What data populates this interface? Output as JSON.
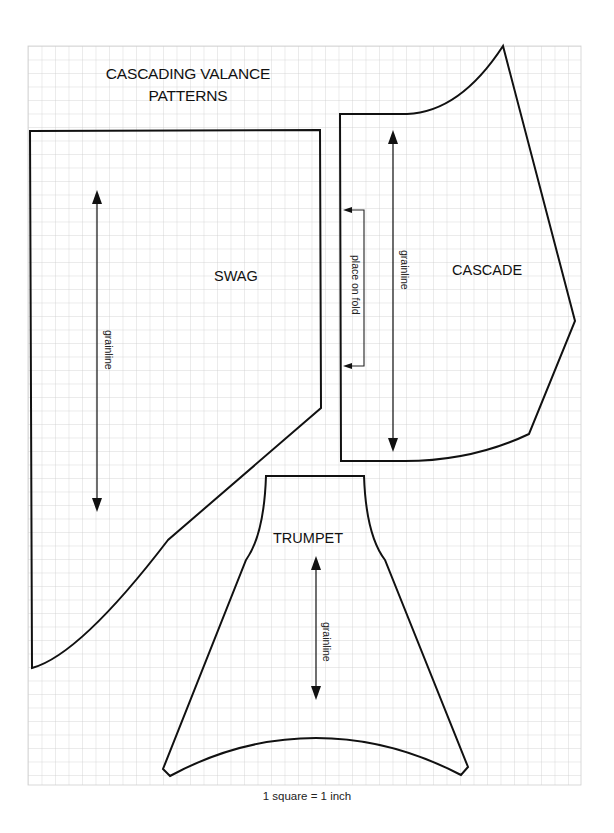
{
  "title": {
    "line1": "CASCADING VALANCE",
    "line2": "PATTERNS"
  },
  "caption": "1 square = 1 inch",
  "grid": {
    "x0": 28,
    "y0": 46,
    "x1": 581,
    "y1": 785,
    "spacing": 13.5,
    "color": "#cfcfcf",
    "scale": "1 square = 1 inch"
  },
  "pieces": [
    {
      "name": "SWAG",
      "label_pos": [
        214,
        268
      ],
      "outline_path": "M30,131 L320,130 L321,408 L168,540 Q80,655 32,668 Z",
      "grainline": {
        "label": "grainline",
        "x": 97,
        "y_top": 190,
        "y_bottom": 512,
        "label_pos": [
          104,
          330
        ]
      }
    },
    {
      "name": "CASCADE",
      "label_pos": [
        452,
        262
      ],
      "outline_path": "M340,114 L407,114 Q460,112 503,46 L575,321 L529,434 Q470,462 400,461 L341,461 Z",
      "grainline": {
        "label": "grainline",
        "x": 393,
        "y_top": 130,
        "y_bottom": 452,
        "label_pos": [
          400,
          250
        ]
      },
      "fold_marker": {
        "label": "place on fold",
        "x_edge": 343,
        "x_bracket": 364,
        "y_top": 210,
        "y_bottom": 366,
        "label_pos": [
          351,
          255
        ]
      }
    },
    {
      "name": "TRUMPET",
      "label_pos": [
        273,
        530
      ],
      "outline_path": "M266,476 L364,476 Q366,535 385,560 L468,767 L461,775 Q390,738 316,738 Q240,738 170,776 L163,769 L246,560 Q264,535 266,476 Z",
      "grainline": {
        "label": "grainline",
        "x": 316,
        "y_top": 556,
        "y_bottom": 700,
        "label_pos": [
          322,
          622
        ]
      }
    }
  ]
}
